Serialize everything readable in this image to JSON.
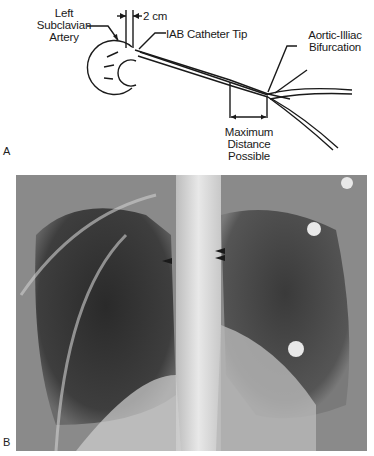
{
  "panel_a": {
    "letter": "A",
    "labels": {
      "left_subclavian_1": "Left",
      "left_subclavian_2": "Subclavian",
      "left_subclavian_3": "Artery",
      "distance": "2 cm",
      "catheter_tip": "IAB Catheter Tip",
      "bifurcation_1": "Aortic-Illiac",
      "bifurcation_2": "Bifurcation",
      "max_1": "Maximum",
      "max_2": "Distance",
      "max_3": "Possible"
    }
  },
  "panel_b": {
    "letter": "B",
    "description": "Chest radiograph with arrows marking catheter tip",
    "arrows": 3
  },
  "colors": {
    "line": "#1a1a1a",
    "xray_dark": "#2b2b2b",
    "xray_light": "#e6e6e6"
  }
}
